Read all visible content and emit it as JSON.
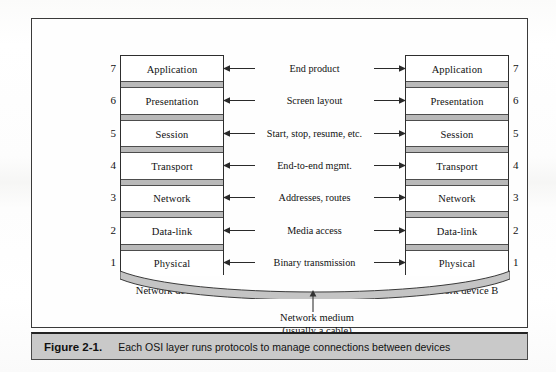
{
  "figure": {
    "caption_label": "Figure 2-1.",
    "caption_text": "Each OSI layer runs protocols to manage connections between devices"
  },
  "diagram": {
    "left_device_label": "Network device A",
    "right_device_label": "Network device B",
    "medium_label_line1": "Network medium",
    "medium_label_line2": "(usually a cable)",
    "layers": [
      {
        "number": "7",
        "name": "Application",
        "description": "End product"
      },
      {
        "number": "6",
        "name": "Presentation",
        "description": "Screen layout"
      },
      {
        "number": "5",
        "name": "Session",
        "description": "Start, stop, resume, etc."
      },
      {
        "number": "4",
        "name": "Transport",
        "description": "End-to-end mgmt."
      },
      {
        "number": "3",
        "name": "Network",
        "description": "Addresses, routes"
      },
      {
        "number": "2",
        "name": "Data-link",
        "description": "Media access"
      },
      {
        "number": "1",
        "name": "Physical",
        "description": "Binary transmission"
      }
    ],
    "colors": {
      "frame_border": "#3a3a3a",
      "caption_bar": "#c9c9c9",
      "separator_fill": "#b9b9b9",
      "cable_fill": "#c4c4c4",
      "box_border": "#2e2e2e",
      "text": "#111111"
    }
  }
}
